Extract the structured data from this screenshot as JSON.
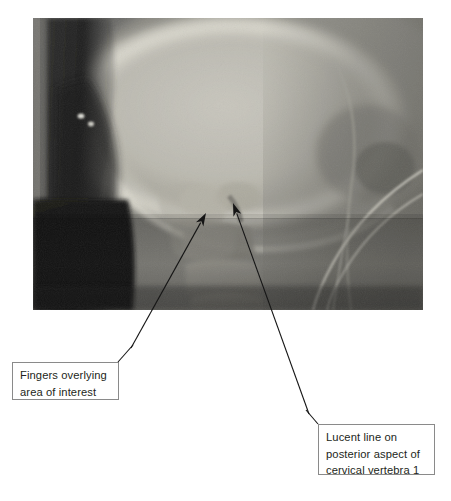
{
  "figure": {
    "type": "radiograph-figure",
    "modality": "x-ray",
    "view": "lateral cervical spine",
    "background_color": "#ffffff"
  },
  "radiograph": {
    "name": "lateral-cervical-spine-radiograph",
    "x": 33,
    "y": 18,
    "width": 390,
    "height": 292,
    "tones": {
      "base_gray": "#6f6f6f",
      "bright_bone": "#d8d6cf",
      "mid_tissue": "#8e8c88",
      "dark_air": "#2a2a2a",
      "deep_black": "#161616",
      "speck_bright": "#efefe8"
    }
  },
  "annotations": [
    {
      "id": "fingers",
      "box_name": "caption-box-fingers",
      "lines": [
        "Fingers overlying",
        "area of interest"
      ],
      "text": "Fingers overlying area of interest",
      "box": {
        "x": 12,
        "y": 362,
        "width": 107,
        "height": 38
      },
      "leader": {
        "from_x": 118,
        "from_y": 362,
        "to_x": 133,
        "to_y": 345
      },
      "arrow": {
        "tail_x": 131,
        "tail_y": 348,
        "tip_x": 206,
        "tip_y": 213
      },
      "border_color": "#8a8a8a",
      "text_color": "#231f20"
    },
    {
      "id": "lucent",
      "box_name": "caption-box-lucent",
      "lines": [
        "Lucent line on",
        "posterior aspect of",
        "cervical vertebra 1"
      ],
      "text": "Lucent line on posterior aspect of cervical vertebra 1",
      "box": {
        "x": 318,
        "y": 424,
        "width": 117,
        "height": 51
      },
      "leader": {
        "from_x": 318,
        "from_y": 424,
        "to_x": 306,
        "to_y": 410
      },
      "arrow": {
        "tail_x": 309,
        "tail_y": 414,
        "tip_x": 233,
        "tip_y": 203
      },
      "border_color": "#8a8a8a",
      "text_color": "#231f20"
    }
  ],
  "arrow_style": {
    "color": "#151515",
    "line_width": 1.1,
    "head_length": 13,
    "head_half_width": 4.2
  }
}
